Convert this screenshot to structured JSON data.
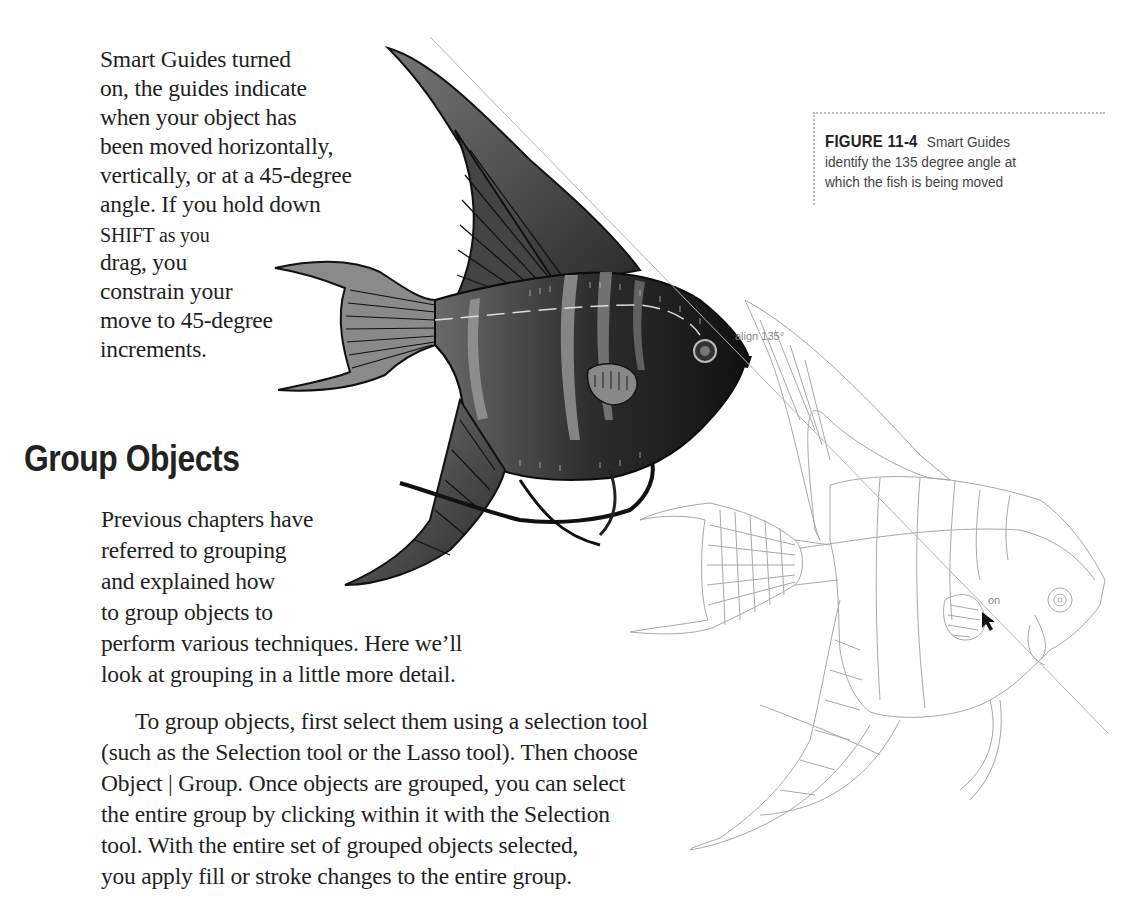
{
  "page": {
    "intro_paragraph": {
      "lines": [
        "Smart Guides turned",
        "on, the guides indicate",
        "when your object has",
        "been moved horizontally,",
        "vertically, or at a 45-degree",
        "angle. If you hold down",
        "SHIFT as you",
        "drag, you",
        "constrain your",
        "move to 45-degree",
        "increments."
      ]
    },
    "section": {
      "heading": "Group Objects",
      "paragraph1_lines": [
        "Previous chapters have",
        "referred to grouping",
        "and explained how",
        "to group objects to",
        "perform various techniques. Here we’ll",
        "look at grouping in a little more detail."
      ],
      "paragraph2_lines": [
        "To group objects, first select them using a selection tool",
        "(such as the Selection tool or the Lasso tool). Then choose",
        "Object | Group. Once objects are grouped, you can select",
        "the entire group by clicking within it with the Selection",
        "tool. With the entire set of grouped objects selected,",
        "you apply fill or stroke changes to the entire group."
      ]
    },
    "figure": {
      "label_word": "Figure",
      "label_number": "11-4",
      "caption": "Smart Guides identify the 135 degree angle at which the fish is being moved",
      "caption_lines": [
        "Smart Guides",
        "identify the 135 degree angle at",
        "which the fish is being moved"
      ],
      "smart_guide_label": "align 135°",
      "cursor_hint": "on",
      "guide_line": {
        "x1": 430,
        "y1": 37,
        "x2": 1108,
        "y2": 733,
        "color": "#b5b5b5"
      },
      "colors": {
        "fish_fill_dark": "#2a2a2a",
        "fish_fill_mid": "#555555",
        "fish_stripe_light": "#8c8c8c",
        "outline_fish_stroke": "#a8a8a8"
      }
    }
  }
}
